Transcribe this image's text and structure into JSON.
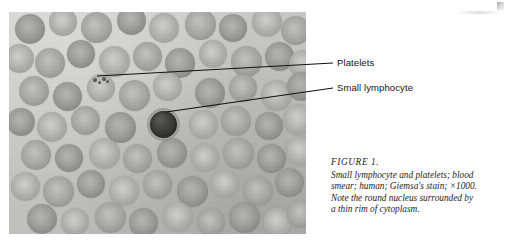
{
  "figure": {
    "caption_head": "FIGURE 1.",
    "caption_lines": [
      "Small lymphocyte and platelets; blood",
      "smear; human; Giemsa's stain; ×1000.",
      "Note the round nucleus surrounded by",
      "a thin rim of cytoplasm."
    ]
  },
  "callouts": {
    "platelets": "Platelets",
    "lymphocyte": "Small lymphocyte"
  },
  "micrograph": {
    "background_color": "#c9c9c7",
    "erythrocyte_color": "#a9a9a6",
    "lymphocyte_nucleus_color": "#343432",
    "platelet_color": "#4b4b49",
    "erythrocytes": [
      {
        "x": 6,
        "y": 2,
        "d": 30,
        "tone": "dark"
      },
      {
        "x": 40,
        "y": -4,
        "d": 28,
        "tone": "pale"
      },
      {
        "x": 72,
        "y": 0,
        "d": 31,
        "tone": "normal"
      },
      {
        "x": 108,
        "y": -6,
        "d": 29,
        "tone": "dark"
      },
      {
        "x": 140,
        "y": 1,
        "d": 30,
        "tone": "pale"
      },
      {
        "x": 176,
        "y": -3,
        "d": 31,
        "tone": "normal"
      },
      {
        "x": 210,
        "y": 2,
        "d": 28,
        "tone": "dark"
      },
      {
        "x": 243,
        "y": -5,
        "d": 30,
        "tone": "pale"
      },
      {
        "x": 272,
        "y": 4,
        "d": 29,
        "tone": "normal"
      },
      {
        "x": -4,
        "y": 32,
        "d": 29,
        "tone": "pale"
      },
      {
        "x": 26,
        "y": 36,
        "d": 30,
        "tone": "normal"
      },
      {
        "x": 58,
        "y": 28,
        "d": 28,
        "tone": "dark"
      },
      {
        "x": 90,
        "y": 34,
        "d": 31,
        "tone": "pale"
      },
      {
        "x": 124,
        "y": 30,
        "d": 29,
        "tone": "normal"
      },
      {
        "x": 156,
        "y": 36,
        "d": 30,
        "tone": "dark"
      },
      {
        "x": 190,
        "y": 28,
        "d": 28,
        "tone": "pale"
      },
      {
        "x": 222,
        "y": 34,
        "d": 31,
        "tone": "normal"
      },
      {
        "x": 256,
        "y": 30,
        "d": 29,
        "tone": "dark"
      },
      {
        "x": 280,
        "y": 38,
        "d": 28,
        "tone": "pale"
      },
      {
        "x": 10,
        "y": 64,
        "d": 30,
        "tone": "normal"
      },
      {
        "x": 44,
        "y": 70,
        "d": 29,
        "tone": "dark"
      },
      {
        "x": 78,
        "y": 62,
        "d": 28,
        "tone": "pale"
      },
      {
        "x": 110,
        "y": 68,
        "d": 31,
        "tone": "normal"
      },
      {
        "x": 144,
        "y": 60,
        "d": 29,
        "tone": "pale"
      },
      {
        "x": 186,
        "y": 66,
        "d": 30,
        "tone": "dark"
      },
      {
        "x": 220,
        "y": 62,
        "d": 28,
        "tone": "normal"
      },
      {
        "x": 252,
        "y": 68,
        "d": 31,
        "tone": "pale"
      },
      {
        "x": 278,
        "y": 60,
        "d": 29,
        "tone": "dark"
      },
      {
        "x": -2,
        "y": 96,
        "d": 28,
        "tone": "dark"
      },
      {
        "x": 28,
        "y": 100,
        "d": 30,
        "tone": "pale"
      },
      {
        "x": 62,
        "y": 94,
        "d": 29,
        "tone": "normal"
      },
      {
        "x": 96,
        "y": 100,
        "d": 31,
        "tone": "dark"
      },
      {
        "x": 180,
        "y": 98,
        "d": 29,
        "tone": "pale"
      },
      {
        "x": 212,
        "y": 94,
        "d": 30,
        "tone": "normal"
      },
      {
        "x": 246,
        "y": 100,
        "d": 28,
        "tone": "dark"
      },
      {
        "x": 274,
        "y": 92,
        "d": 31,
        "tone": "pale"
      },
      {
        "x": 12,
        "y": 128,
        "d": 30,
        "tone": "normal"
      },
      {
        "x": 46,
        "y": 132,
        "d": 28,
        "tone": "dark"
      },
      {
        "x": 80,
        "y": 126,
        "d": 31,
        "tone": "pale"
      },
      {
        "x": 114,
        "y": 132,
        "d": 29,
        "tone": "normal"
      },
      {
        "x": 148,
        "y": 126,
        "d": 30,
        "tone": "dark"
      },
      {
        "x": 182,
        "y": 132,
        "d": 28,
        "tone": "pale"
      },
      {
        "x": 214,
        "y": 126,
        "d": 31,
        "tone": "normal"
      },
      {
        "x": 248,
        "y": 132,
        "d": 29,
        "tone": "dark"
      },
      {
        "x": 276,
        "y": 124,
        "d": 30,
        "tone": "pale"
      },
      {
        "x": 2,
        "y": 160,
        "d": 29,
        "tone": "pale"
      },
      {
        "x": 34,
        "y": 164,
        "d": 31,
        "tone": "normal"
      },
      {
        "x": 68,
        "y": 158,
        "d": 28,
        "tone": "dark"
      },
      {
        "x": 100,
        "y": 164,
        "d": 30,
        "tone": "pale"
      },
      {
        "x": 134,
        "y": 158,
        "d": 29,
        "tone": "normal"
      },
      {
        "x": 168,
        "y": 164,
        "d": 31,
        "tone": "dark"
      },
      {
        "x": 202,
        "y": 158,
        "d": 28,
        "tone": "pale"
      },
      {
        "x": 234,
        "y": 164,
        "d": 30,
        "tone": "normal"
      },
      {
        "x": 266,
        "y": 156,
        "d": 29,
        "tone": "dark"
      },
      {
        "x": 18,
        "y": 192,
        "d": 30,
        "tone": "dark"
      },
      {
        "x": 52,
        "y": 196,
        "d": 28,
        "tone": "pale"
      },
      {
        "x": 86,
        "y": 190,
        "d": 31,
        "tone": "normal"
      },
      {
        "x": 120,
        "y": 196,
        "d": 29,
        "tone": "dark"
      },
      {
        "x": 154,
        "y": 190,
        "d": 30,
        "tone": "pale"
      },
      {
        "x": 188,
        "y": 196,
        "d": 28,
        "tone": "normal"
      },
      {
        "x": 220,
        "y": 190,
        "d": 31,
        "tone": "dark"
      },
      {
        "x": 254,
        "y": 196,
        "d": 29,
        "tone": "pale"
      },
      {
        "x": 278,
        "y": 188,
        "d": 28,
        "tone": "normal"
      }
    ],
    "platelets": [
      {
        "x": 84,
        "y": 66,
        "d": 4
      },
      {
        "x": 89,
        "y": 69,
        "d": 3
      },
      {
        "x": 93,
        "y": 65,
        "d": 4
      },
      {
        "x": 97,
        "y": 68,
        "d": 3
      }
    ],
    "lymphocyte": {
      "x": 141,
      "y": 99,
      "d": 27
    }
  }
}
